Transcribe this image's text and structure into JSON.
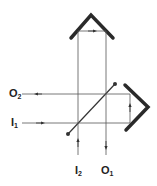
{
  "diagram": {
    "labels": {
      "o2": {
        "main": "O",
        "sub": "2"
      },
      "i1": {
        "main": "I",
        "sub": "1"
      },
      "i2": {
        "main": "I",
        "sub": "2"
      },
      "o1": {
        "main": "O",
        "sub": "1"
      }
    },
    "colors": {
      "line": "#333333",
      "mirror": "#2a2a2a"
    }
  }
}
